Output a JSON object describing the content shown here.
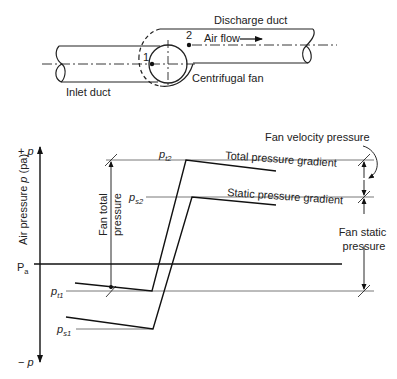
{
  "duct_schematic": {
    "discharge_label": "Discharge duct",
    "air_flow_label": "Air flow",
    "inlet_label": "Inlet duct",
    "fan_label": "Centrifugal fan",
    "point_1_label": "1",
    "point_2_label": "2"
  },
  "pressure_chart": {
    "y_axis_label": "Air pressure p (pa)",
    "y_axis_label_parts": {
      "prefix": "Air pressure ",
      "var": "p",
      "suffix": " (pa)"
    },
    "y_top_label": {
      "sign": "+ ",
      "var": "p"
    },
    "y_bottom_label": {
      "sign": "− ",
      "var": "p"
    },
    "atmospheric_label": {
      "base": "P",
      "sub": "a"
    },
    "levels": {
      "pt2": {
        "base": "p",
        "sub": "t2"
      },
      "ps2": {
        "base": "p",
        "sub": "s2"
      },
      "pt1": {
        "base": "p",
        "sub": "t1"
      },
      "ps1": {
        "base": "p",
        "sub": "s1"
      }
    },
    "total_gradient_label": "Total pressure gradient",
    "static_gradient_label": "Static pressure gradient",
    "fan_total_pressure_label": [
      "Fan total",
      "pressure"
    ],
    "fan_velocity_pressure_label": "Fan velocity pressure",
    "fan_static_pressure_label": [
      "Fan static",
      "pressure"
    ]
  }
}
